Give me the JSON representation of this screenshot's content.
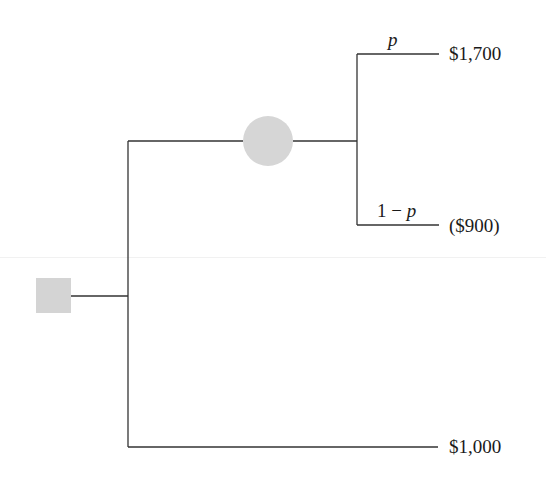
{
  "diagram": {
    "type": "decision-tree",
    "decision_node": {
      "shape": "square",
      "color": "#d4d4d4"
    },
    "chance_node": {
      "shape": "circle",
      "color": "#d6d6d6"
    },
    "line_color": "#333333",
    "branches": {
      "top_probability": "p",
      "top_outcome": "$1,700",
      "middle_probability_left": "1 − ",
      "middle_probability_var": "p",
      "middle_outcome": "($900)",
      "bottom_outcome": "$1,000"
    }
  }
}
